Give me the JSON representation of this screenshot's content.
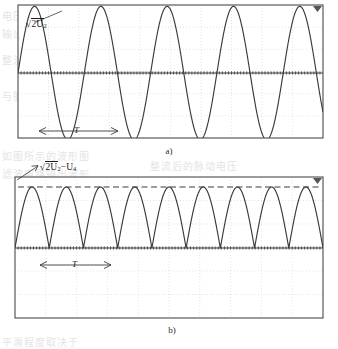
{
  "figure": {
    "background_color": "#ffffff",
    "ink_color": "#3a3a3a",
    "grid_color": "#d9d9dd",
    "bleed_color": "#c9c9cd"
  },
  "panels": [
    {
      "id": "panel-a",
      "caption": "a)",
      "signal_label": "2U",
      "signal_label_sub": "2",
      "signal_label_full": "√2U₂",
      "period_label": "T",
      "waveform": "sine",
      "cycles": 4.6,
      "baseline": "zero-axis-centered",
      "has_dashed_peak_line": false,
      "frame": {
        "x": 18,
        "y": 5,
        "width": 305,
        "height": 133
      },
      "zero_axis_y": 73,
      "grid_columns": 10,
      "grid_rows": 6,
      "corner_marker": "triangle-marker"
    },
    {
      "id": "panel-b",
      "caption": "b)",
      "signal_label": "2U",
      "signal_label_sub": "2",
      "signal_label_sub2": "4",
      "signal_label_full": "√2U₂ − U₄",
      "period_label": "T",
      "waveform": "full-wave-rectified-sine",
      "humps": 9,
      "baseline": "zero-axis-upper",
      "has_dashed_peak_line": true,
      "frame": {
        "x": 15,
        "y": 177,
        "width": 308,
        "height": 141
      },
      "zero_axis_y": 248,
      "peak_line_y": 187,
      "grid_columns": 10,
      "grid_rows": 6,
      "corner_marker": "triangle-marker"
    }
  ],
  "chart_data": [
    {
      "type": "line",
      "id": "panel-a-chart",
      "title": "a)",
      "xlabel": "",
      "ylabel": "",
      "series": [
        {
          "name": "√2U₂",
          "function": "sine",
          "amplitude": 1.0,
          "periods_shown": 4.6,
          "phase_deg": 0,
          "dc_offset": 0
        }
      ],
      "annotations": [
        {
          "text": "√2U₂",
          "kind": "peak-amplitude-label",
          "x_frac": 0.07,
          "y_frac": 0.12
        },
        {
          "text": "T",
          "kind": "period-span-arrow",
          "x_frac": 0.13,
          "y_frac": 0.93,
          "span_periods": 1
        }
      ],
      "ylim": [
        -1.15,
        1.15
      ],
      "xlim": [
        0,
        4.6
      ],
      "grid": true,
      "legend": "none"
    },
    {
      "type": "line",
      "id": "panel-b-chart",
      "title": "b)",
      "xlabel": "",
      "ylabel": "",
      "series": [
        {
          "name": "√2U₂ − U₄",
          "function": "abs-sine",
          "amplitude": 1.0,
          "humps_shown": 9,
          "phase_deg": 0,
          "dc_offset": 0
        }
      ],
      "annotations": [
        {
          "text": "√2U₂ − U₄",
          "kind": "peak-amplitude-label",
          "x_frac": 0.08,
          "y_frac": -0.08
        },
        {
          "text": "T",
          "kind": "period-span-arrow",
          "x_frac": 0.12,
          "y_frac": 0.55,
          "span_humps": 2
        },
        {
          "kind": "dashed-peak-reference-line",
          "y_value": 1.0
        }
      ],
      "ylim": [
        -1.6,
        1.15
      ],
      "xlim": [
        0,
        9
      ],
      "grid": true,
      "legend": "none"
    }
  ],
  "bleed_text": [
    {
      "text": "电压波形如图所示",
      "x": 2,
      "y": 8
    },
    {
      "text": "输出电压的平均值",
      "x": 2,
      "y": 26
    },
    {
      "text": "整流电路中的波形",
      "x": 2,
      "y": 52
    },
    {
      "text": "与脉动系数的关系",
      "x": 2,
      "y": 88
    },
    {
      "text": "如图所示的波形图",
      "x": 2,
      "y": 148
    },
    {
      "text": "整流后的脉动电压",
      "x": 150,
      "y": 158
    },
    {
      "text": "滤波电路输出波形",
      "x": 2,
      "y": 166
    },
    {
      "text": "平滑程度取决于",
      "x": 2,
      "y": 334
    }
  ]
}
